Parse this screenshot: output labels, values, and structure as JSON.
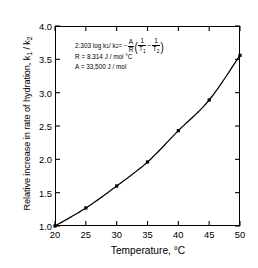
{
  "chart_data": {
    "type": "line",
    "title": "",
    "xlabel": "Temperature, °C",
    "ylabel": "Relative increase in rate of hydration, k1 / k2",
    "x": [
      20,
      25,
      30,
      35,
      40,
      45,
      50
    ],
    "values": [
      1.0,
      1.27,
      1.6,
      1.96,
      2.43,
      2.89,
      3.56
    ],
    "series": [
      {
        "name": "Relative increase in rate of hydration",
        "values": [
          1.0,
          1.27,
          1.6,
          1.96,
          2.43,
          2.89,
          3.56
        ]
      }
    ],
    "xlim": [
      20,
      50
    ],
    "ylim": [
      1.0,
      4.0
    ],
    "xticks": [
      "20",
      "25",
      "30",
      "35",
      "40",
      "45",
      "50"
    ],
    "yticks": [
      "1.0",
      "1.5",
      "2.0",
      "2.5",
      "3.0",
      "3.5",
      "4.0"
    ],
    "grid": false,
    "legend": "none",
    "marker": "filled-square",
    "line_color": "#000000",
    "marker_color": "#000000",
    "background": "#ffffff"
  },
  "axes": {
    "ylabel_main": "Relative increase in rate of hydration, k",
    "ylabel_sub1": "1",
    "ylabel_mid": " / k",
    "ylabel_sub2": "2",
    "xlabel": "Temperature, °C"
  },
  "annotation": {
    "line1_lead": "2.303 log k",
    "line1_sub1": "1",
    "line1_slash": " / k",
    "line1_sub2": "2",
    "line1_eq": " = −",
    "frac1_num": "A",
    "frac1_den": "R",
    "open_paren": "(",
    "frac2_num": "1",
    "frac2_den_main": "T",
    "frac2_den_sub": "1",
    "inner_minus": "−",
    "frac3_num": "1",
    "frac3_den_main": "T",
    "frac3_den_sub": "2",
    "close_paren": ")",
    "line2": "R = 8.314 J / mol °C",
    "line3": "A = 33,500 J / mol"
  }
}
